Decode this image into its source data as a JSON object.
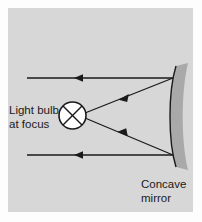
{
  "figure": {
    "panel": {
      "background_color": "#d7d7d7",
      "outer_background_color": "#fdfdfd",
      "x": 8,
      "y": 8,
      "width": 185,
      "height": 204
    },
    "labels": {
      "source_label_line1": "Light bulb",
      "source_label_line2": "at focus",
      "mirror_label_line1": "Concave",
      "mirror_label_line2": "mirror"
    },
    "elements": {
      "bulb": {
        "name": "light bulb at focus",
        "symbol": "circle-with-cross",
        "center_x": 72.5,
        "center_y": 115.5,
        "radius": 13.5,
        "fill_color": "#ffffff",
        "stroke_color": "#1a1a1a"
      },
      "mirror": {
        "name": "concave mirror",
        "fill_color": "#a9a9a9",
        "stroke_color": "#1a1a1a",
        "top_y": 66,
        "bottom_y": 167,
        "front_surface_x": 172,
        "back_surface_x": 188
      }
    },
    "rays": [
      {
        "name": "incoming-ray-top",
        "type": "parallel",
        "x1": 27,
        "y1": 78,
        "x2": 173,
        "y2": 78,
        "arrow_x": 78,
        "arrow_y": 78,
        "arrow_direction": "left"
      },
      {
        "name": "incoming-ray-bottom",
        "type": "parallel",
        "x1": 27,
        "y1": 155,
        "x2": 173,
        "y2": 155,
        "arrow_x": 78,
        "arrow_y": 155,
        "arrow_direction": "left"
      },
      {
        "name": "reflected-ray-upper",
        "type": "converging",
        "x1": 173,
        "y1": 78,
        "x2": 85,
        "y2": 113,
        "arrow_x": 123,
        "arrow_y": 97.9,
        "arrow_direction": "left-down"
      },
      {
        "name": "reflected-ray-lower",
        "type": "converging",
        "x1": 173,
        "y1": 155,
        "x2": 85,
        "y2": 118,
        "arrow_x": 122,
        "arrow_y": 133.5,
        "arrow_direction": "left-up"
      }
    ],
    "stroke_color": "#1a1a1a"
  }
}
